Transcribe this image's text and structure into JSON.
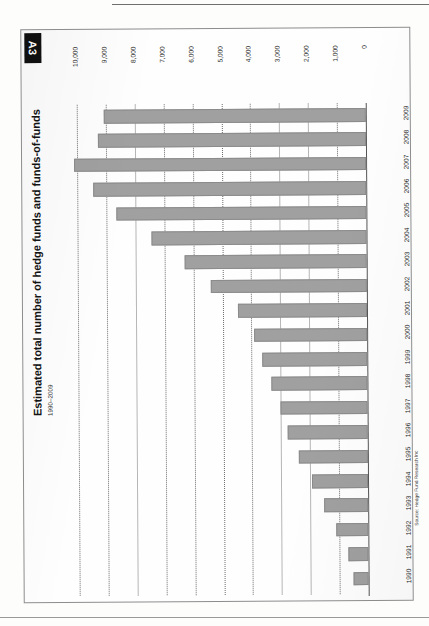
{
  "exhibit": {
    "tag": "A3",
    "title": "Estimated total number of hedge funds and funds-of-funds",
    "subtitle": "1990–2009",
    "source": "Source: Hedge Fund Research Inc"
  },
  "colors": {
    "bar_fill": "#a0a0a0",
    "bar_stroke": "#8b8b8b",
    "gridline": "#6d6d6d",
    "tag_background": "#101010",
    "tag_text": "#ffffff",
    "page_background": "#fdfdfc",
    "border": "#8d8d8d"
  },
  "chart_data": {
    "type": "bar",
    "orientation": "horizontal",
    "title": "Estimated total number of hedge funds and funds-of-funds",
    "subtitle": "1990–2009",
    "xlabel": "",
    "ylabel": "",
    "xlim": [
      0,
      10000
    ],
    "x_axis_reversed": true,
    "x_axis_position": "top",
    "grid": true,
    "grid_style": "dotted-vertical",
    "legend": "none",
    "value_ticks": [
      "10,000",
      "9,000",
      "8,000",
      "7,000",
      "6,000",
      "5,000",
      "4,000",
      "3,000",
      "2,000",
      "1,000",
      "0"
    ],
    "value_tick_numbers": [
      10000,
      9000,
      8000,
      7000,
      6000,
      5000,
      4000,
      3000,
      2000,
      1000,
      0
    ],
    "categories": [
      "2009",
      "2008",
      "2007",
      "2006",
      "2005",
      "2004",
      "2003",
      "2002",
      "2001",
      "2000",
      "1999",
      "1998",
      "1997",
      "1996",
      "1995",
      "1994",
      "1993",
      "1992",
      "1991",
      "1990"
    ],
    "values": [
      9050,
      9280,
      10100,
      9460,
      8660,
      7440,
      6300,
      5400,
      4450,
      3900,
      3620,
      3330,
      3000,
      2780,
      2390,
      1950,
      1510,
      1100,
      700,
      530
    ],
    "series": [
      {
        "name": "Estimated total number of hedge funds and funds-of-funds",
        "values": [
          9050,
          9280,
          10100,
          9460,
          8660,
          7440,
          6300,
          5400,
          4450,
          3900,
          3620,
          3330,
          3000,
          2780,
          2390,
          1950,
          1510,
          1100,
          700,
          530
        ]
      }
    ],
    "source": "Source: Hedge Fund Research Inc"
  }
}
